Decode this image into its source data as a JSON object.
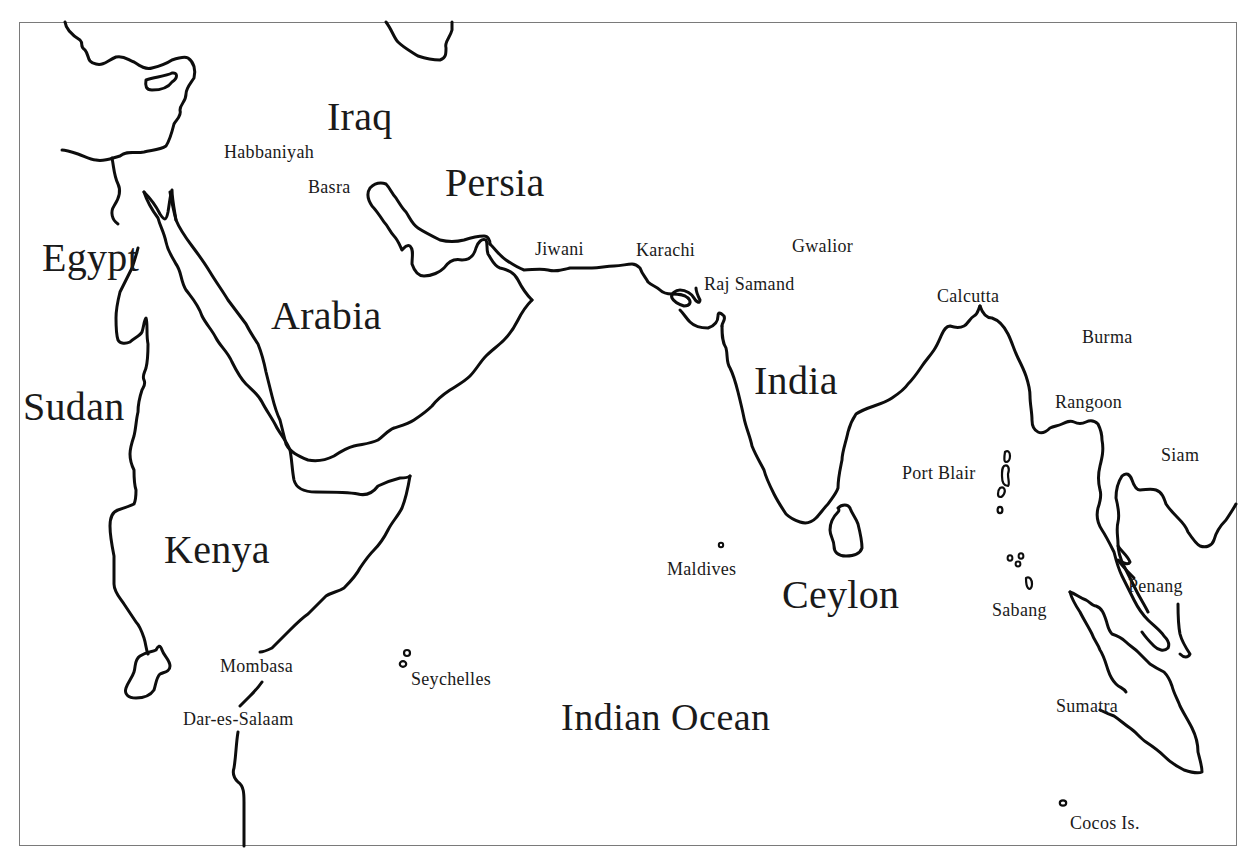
{
  "map": {
    "frame_color": "#7a7a7a",
    "line_color": "#0d0d0d",
    "background": "#ffffff",
    "region_labels": [
      {
        "id": "iraq",
        "text": "Iraq",
        "x": 327,
        "y": 97
      },
      {
        "id": "persia",
        "text": "Persia",
        "x": 445,
        "y": 163
      },
      {
        "id": "egypt",
        "text": "Egypt",
        "x": 42,
        "y": 238
      },
      {
        "id": "arabia",
        "text": "Arabia",
        "x": 271,
        "y": 296
      },
      {
        "id": "india",
        "text": "India",
        "x": 754,
        "y": 361
      },
      {
        "id": "sudan",
        "text": "Sudan",
        "x": 23,
        "y": 387
      },
      {
        "id": "kenya",
        "text": "Kenya",
        "x": 164,
        "y": 530
      },
      {
        "id": "ceylon",
        "text": "Ceylon",
        "x": 782,
        "y": 575
      }
    ],
    "ocean_label": {
      "id": "indian-ocean",
      "text": "Indian Ocean",
      "x": 561,
      "y": 698
    },
    "place_labels": [
      {
        "id": "habbaniyah",
        "text": "Habbaniyah",
        "x": 224,
        "y": 143
      },
      {
        "id": "basra",
        "text": "Basra",
        "x": 308,
        "y": 178
      },
      {
        "id": "jiwani",
        "text": "Jiwani",
        "x": 535,
        "y": 240
      },
      {
        "id": "karachi",
        "text": "Karachi",
        "x": 636,
        "y": 241
      },
      {
        "id": "gwalior",
        "text": "Gwalior",
        "x": 792,
        "y": 237
      },
      {
        "id": "raj-samand",
        "text": "Raj Samand",
        "x": 704,
        "y": 275
      },
      {
        "id": "calcutta",
        "text": "Calcutta",
        "x": 937,
        "y": 287
      },
      {
        "id": "burma",
        "text": "Burma",
        "x": 1082,
        "y": 328
      },
      {
        "id": "rangoon",
        "text": "Rangoon",
        "x": 1055,
        "y": 393
      },
      {
        "id": "siam",
        "text": "Siam",
        "x": 1161,
        "y": 446
      },
      {
        "id": "port-blair",
        "text": "Port Blair",
        "x": 902,
        "y": 464
      },
      {
        "id": "maldives",
        "text": "Maldives",
        "x": 667,
        "y": 560
      },
      {
        "id": "penang",
        "text": "Penang",
        "x": 1128,
        "y": 577
      },
      {
        "id": "sabang",
        "text": "Sabang",
        "x": 992,
        "y": 601
      },
      {
        "id": "mombasa",
        "text": "Mombasa",
        "x": 220,
        "y": 657,
        "bg": true
      },
      {
        "id": "seychelles",
        "text": "Seychelles",
        "x": 411,
        "y": 670
      },
      {
        "id": "sumatra",
        "text": "Sumatra",
        "x": 1056,
        "y": 697
      },
      {
        "id": "dar-es-salaam",
        "text": "Dar-es-Salaam",
        "x": 183,
        "y": 710,
        "bg": true
      },
      {
        "id": "cocos-is",
        "text": "Cocos Is.",
        "x": 1070,
        "y": 814
      }
    ]
  }
}
